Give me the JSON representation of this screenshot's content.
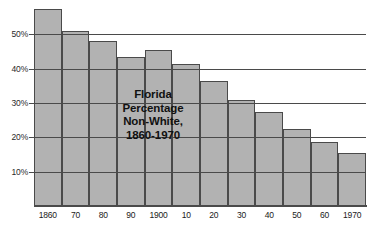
{
  "chart_data": {
    "type": "bar",
    "title_lines": [
      "Florida",
      "Percentage",
      "Non-White,",
      "1860-1970"
    ],
    "xlabel": "",
    "ylabel": "",
    "categories": [
      "1860",
      "70",
      "80",
      "90",
      "1900",
      "10",
      "20",
      "30",
      "40",
      "50",
      "60",
      "1970"
    ],
    "values": [
      57.5,
      51,
      48,
      43.5,
      45.5,
      41.5,
      36.5,
      31,
      27.5,
      22.5,
      18.5,
      15.5
    ],
    "ylim": [
      0,
      60
    ],
    "ytick_labels": [
      "10%",
      "20%",
      "30%",
      "40%",
      "50%"
    ],
    "ytick_values": [
      10,
      20,
      30,
      40,
      50
    ],
    "grid": true,
    "legend": null,
    "bar_color": "#b2b2b2",
    "bar_edge_color": "#4a4a4a",
    "background_color": "#ffffff",
    "text_color": "#1a1a1a"
  }
}
